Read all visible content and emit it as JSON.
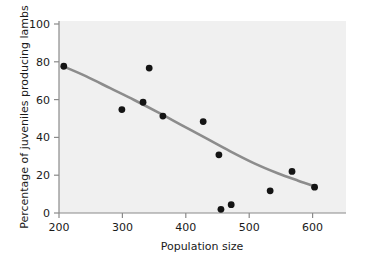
{
  "chart_data": {
    "type": "scatter",
    "title": "",
    "xlabel": "Population size",
    "ylabel": "Percentage of juveniles producing lambs",
    "xlim": [
      200,
      620
    ],
    "ylim": [
      0,
      104
    ],
    "xticks": [
      200,
      300,
      400,
      500,
      600
    ],
    "yticks": [
      0,
      20,
      40,
      60,
      80,
      100
    ],
    "xtick_labels": [
      "200",
      "300",
      "400",
      "500",
      "600"
    ],
    "ytick_labels": [
      "0",
      "20",
      "40",
      "60",
      "80",
      "100"
    ],
    "grid": false,
    "legend": "none",
    "point_color": "#141414",
    "curve_color": "#8c8c8c",
    "panel_color": "#f0f0f0",
    "points": [
      {
        "x": 207,
        "y": 79.5
      },
      {
        "x": 292,
        "y": 56.0
      },
      {
        "x": 323,
        "y": 60.0
      },
      {
        "x": 332,
        "y": 78.5
      },
      {
        "x": 352,
        "y": 52.5
      },
      {
        "x": 411,
        "y": 49.5
      },
      {
        "x": 434,
        "y": 31.5
      },
      {
        "x": 437,
        "y": 2.0
      },
      {
        "x": 452,
        "y": 4.5
      },
      {
        "x": 509,
        "y": 12.0
      },
      {
        "x": 541,
        "y": 22.5
      },
      {
        "x": 574,
        "y": 14.0
      }
    ],
    "curve": [
      {
        "x": 207,
        "y": 79.3
      },
      {
        "x": 240,
        "y": 74.0
      },
      {
        "x": 275,
        "y": 67.6
      },
      {
        "x": 310,
        "y": 61.2
      },
      {
        "x": 345,
        "y": 54.5
      },
      {
        "x": 380,
        "y": 47.5
      },
      {
        "x": 415,
        "y": 40.5
      },
      {
        "x": 450,
        "y": 33.5
      },
      {
        "x": 485,
        "y": 27.0
      },
      {
        "x": 520,
        "y": 21.5
      },
      {
        "x": 550,
        "y": 17.5
      },
      {
        "x": 574,
        "y": 14.5
      }
    ]
  }
}
